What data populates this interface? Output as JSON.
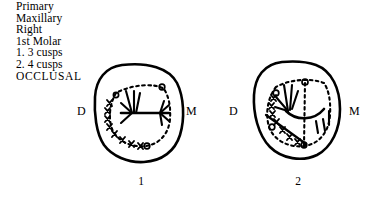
{
  "figure": {
    "background_color": "#ffffff",
    "ink_color": "#000000",
    "caption": {
      "lines": [
        "Primary",
        "Maxillary",
        "Right",
        "1st  Molar",
        "1.  3 cusps",
        "2.  4 cusps",
        "OCCLUSAL"
      ]
    },
    "teeth": [
      {
        "number": "1",
        "variant_label": "3 cusps",
        "distal_label": "D",
        "mesial_label": "M",
        "cusp_count": 3
      },
      {
        "number": "2",
        "variant_label": "4 cusps",
        "distal_label": "D",
        "mesial_label": "M",
        "cusp_count": 4
      }
    ]
  }
}
